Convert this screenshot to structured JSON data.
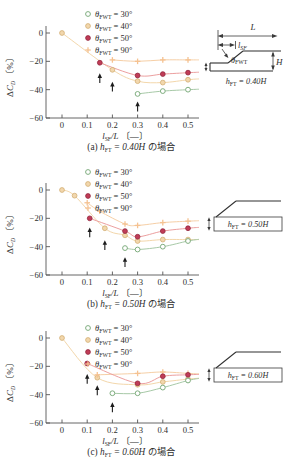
{
  "figure": {
    "background": "#ffffff"
  },
  "axis": {
    "ylabel": {
      "delta": "Δ",
      "sym": "C",
      "sub": "D",
      "unit": " 〔%〕"
    },
    "xlabel": {
      "sym": "l",
      "sub": "SF",
      "rest": "/L",
      "unit": " 〔—〕"
    },
    "x_tick_labels": [
      "0",
      "0.1",
      "0.2",
      "0.3",
      "0.4",
      "0.5"
    ],
    "y_tick_labels": [
      "0",
      "−20",
      "−40",
      "−60"
    ]
  },
  "legend": [
    {
      "sym": "θ",
      "sub": "FWT",
      "val": " = 30°"
    },
    {
      "sym": "θ",
      "sub": "FWT",
      "val": " = 40°"
    },
    {
      "sym": "θ",
      "sub": "FWT",
      "val": " = 50°"
    },
    {
      "sym": "θ",
      "sub": "FWT",
      "val": " = 90°"
    }
  ],
  "panels": [
    {
      "caption": {
        "pre": "(a) ",
        "sym": "h",
        "sub": "FT",
        "val": " = 0.40H",
        "suffix": " の場合"
      },
      "inset_caption": {
        "sym": "h",
        "sub": "FT",
        "val": " = 0.40H"
      }
    },
    {
      "caption": {
        "pre": "(b) ",
        "sym": "h",
        "sub": "FT",
        "val": " = 0.50H",
        "suffix": " の場合"
      },
      "inset_caption": {
        "sym": "h",
        "sub": "FT",
        "val": " = 0.50H"
      }
    },
    {
      "caption": {
        "pre": "(c) ",
        "sym": "h",
        "sub": "FT",
        "val": " = 0.60H",
        "suffix": " の場合"
      },
      "inset_caption": {
        "sym": "h",
        "sub": "FT",
        "val": " = 0.60H"
      }
    }
  ],
  "inset_a": {
    "L": "L",
    "l_sym": "l",
    "l_sub": "SF",
    "theta_sym": "θ",
    "theta_sub": "FWT",
    "H": "H"
  },
  "colors": {
    "axis": "#555555",
    "text": "#2e2e2e",
    "arrow": "#1c1c1c",
    "green": "#7fae7f",
    "green_line": "#a7c9a7",
    "tan": "#f2d7ad",
    "tan_edge": "#d3ae74",
    "tan_line": "#f3d7ab",
    "red": "#c03c57",
    "red_edge": "#93263e",
    "red_line": "#ec9f9f",
    "orange": "#f5c291",
    "orange_line": "#f6cfa6"
  },
  "chart_data": [
    {
      "type": "scatter",
      "title": "(a) hFT = 0.40H の場合",
      "xlabel": "lSF/L 〔—〕",
      "ylabel": "ΔCD 〔%〕",
      "xlim": [
        0,
        0.55
      ],
      "ylim": [
        -60,
        2
      ],
      "x_ticks": [
        0,
        0.1,
        0.2,
        0.3,
        0.4,
        0.5
      ],
      "y_ticks": [
        0,
        -20,
        -40,
        -60
      ],
      "legend_position": "top-center",
      "series": [
        {
          "name": "θFWT = 30°",
          "marker": "open-circle",
          "color": "#7fae7f",
          "edge": "#7fae7f",
          "line": "#a7c9a7",
          "points": [
            [
              0.3,
              -43
            ],
            [
              0.4,
              -41
            ],
            [
              0.5,
              -40
            ]
          ]
        },
        {
          "name": "θFWT = 40°",
          "marker": "filled-circle",
          "color": "#f2d7ad",
          "edge": "#d3ae74",
          "line": "#f3d7ab",
          "points": [
            [
              0,
              0
            ],
            [
              0.2,
              -26
            ],
            [
              0.3,
              -34
            ],
            [
              0.4,
              -35
            ],
            [
              0.5,
              -33
            ]
          ]
        },
        {
          "name": "θFWT = 50°",
          "marker": "filled-circle",
          "color": "#c03c57",
          "edge": "#93263e",
          "line": "#ec9f9f",
          "points": [
            [
              0.15,
              -21
            ],
            [
              0.3,
              -30
            ],
            [
              0.4,
              -29
            ],
            [
              0.5,
              -28
            ]
          ]
        },
        {
          "name": "θFWT = 90°",
          "marker": "plus",
          "color": "#f5c291",
          "edge": "#f5c291",
          "line": "#f6cfa6",
          "points": [
            [
              0.2,
              -19
            ],
            [
              0.3,
              -20
            ],
            [
              0.4,
              -19
            ],
            [
              0.5,
              -19
            ]
          ]
        }
      ],
      "black_arrows_up": [
        [
          0.15,
          -29
        ],
        [
          0.2,
          -35
        ],
        [
          0.3,
          -49
        ]
      ]
    },
    {
      "type": "scatter",
      "title": "(b) hFT = 0.50H の場合",
      "xlabel": "lSF/L 〔—〕",
      "ylabel": "ΔCD 〔%〕",
      "xlim": [
        0,
        0.55
      ],
      "ylim": [
        -60,
        2
      ],
      "x_ticks": [
        0,
        0.1,
        0.2,
        0.3,
        0.4,
        0.5
      ],
      "y_ticks": [
        0,
        -20,
        -40,
        -60
      ],
      "legend_position": "top-center",
      "series": [
        {
          "name": "θFWT = 30°",
          "marker": "open-circle",
          "color": "#7fae7f",
          "edge": "#7fae7f",
          "line": "#a7c9a7",
          "points": [
            [
              0.25,
              -41
            ],
            [
              0.3,
              -42
            ],
            [
              0.4,
              -40
            ],
            [
              0.5,
              -36
            ]
          ]
        },
        {
          "name": "θFWT = 40°",
          "marker": "filled-circle",
          "color": "#f2d7ad",
          "edge": "#d3ae74",
          "line": "#f3d7ab",
          "points": [
            [
              0,
              0
            ],
            [
              0.05,
              -4
            ],
            [
              0.17,
              -27
            ],
            [
              0.25,
              -32
            ],
            [
              0.3,
              -36
            ],
            [
              0.4,
              -35
            ],
            [
              0.5,
              -35
            ]
          ]
        },
        {
          "name": "θFWT = 50°",
          "marker": "filled-circle",
          "color": "#c03c57",
          "edge": "#93263e",
          "line": "#ec9f9f",
          "points": [
            [
              0.11,
              -20
            ],
            [
              0.25,
              -29
            ],
            [
              0.3,
              -33
            ],
            [
              0.4,
              -29
            ],
            [
              0.5,
              -27
            ]
          ]
        },
        {
          "name": "θFWT = 90°",
          "marker": "plus",
          "color": "#f5c291",
          "edge": "#f5c291",
          "line": "#f6cfa6",
          "points": [
            [
              0.1,
              -9
            ],
            [
              0.15,
              -15
            ],
            [
              0.25,
              -24
            ],
            [
              0.3,
              -25
            ],
            [
              0.4,
              -23
            ],
            [
              0.5,
              -22
            ]
          ]
        }
      ],
      "black_arrows_up": [
        [
          0.11,
          -27
        ],
        [
          0.17,
          -36
        ],
        [
          0.25,
          -48
        ]
      ]
    },
    {
      "type": "scatter",
      "title": "(c) hFT = 0.60H の場合",
      "xlabel": "lSF/L 〔—〕",
      "ylabel": "ΔCD 〔%〕",
      "xlim": [
        0,
        0.55
      ],
      "ylim": [
        -60,
        2
      ],
      "x_ticks": [
        0,
        0.1,
        0.2,
        0.3,
        0.4,
        0.5
      ],
      "y_ticks": [
        0,
        -20,
        -40,
        -60
      ],
      "legend_position": "top-center",
      "series": [
        {
          "name": "θFWT = 30°",
          "marker": "open-circle",
          "color": "#7fae7f",
          "edge": "#7fae7f",
          "line": "#a7c9a7",
          "points": [
            [
              0.2,
              -39
            ],
            [
              0.3,
              -39
            ],
            [
              0.4,
              -35
            ],
            [
              0.5,
              -30
            ]
          ]
        },
        {
          "name": "θFWT = 40°",
          "marker": "filled-circle",
          "color": "#f2d7ad",
          "edge": "#d3ae74",
          "line": "#f3d7ab",
          "points": [
            [
              0,
              0
            ],
            [
              0.14,
              -28
            ],
            [
              0.3,
              -33
            ],
            [
              0.4,
              -31
            ],
            [
              0.5,
              -29
            ]
          ]
        },
        {
          "name": "θFWT = 50°",
          "marker": "filled-circle",
          "color": "#c03c57",
          "edge": "#93263e",
          "line": "#ec9f9f",
          "points": [
            [
              0.1,
              -18
            ],
            [
              0.3,
              -32
            ],
            [
              0.4,
              -27
            ],
            [
              0.5,
              -26
            ]
          ]
        },
        {
          "name": "θFWT = 90°",
          "marker": "plus",
          "color": "#f5c291",
          "edge": "#f5c291",
          "line": "#f6cfa6",
          "points": [
            [
              0.14,
              -26
            ],
            [
              0.3,
              -25
            ],
            [
              0.4,
              -24
            ],
            [
              0.5,
              -25
            ]
          ]
        }
      ],
      "black_arrows_up": [
        [
          0.1,
          -26
        ],
        [
          0.14,
          -34
        ],
        [
          0.2,
          -46
        ]
      ]
    }
  ]
}
